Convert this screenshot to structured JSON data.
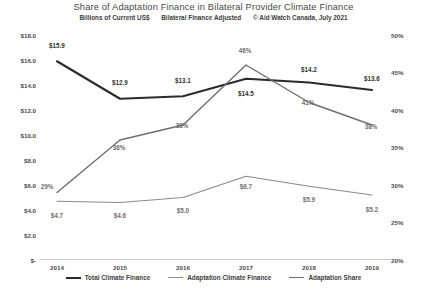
{
  "chart_data": {
    "type": "line",
    "title": "Share of Adaptation Finance in Bilateral Provider Climate Finance",
    "subtitle_parts": [
      "Billions of Current US$",
      "Bilateral Finance Adjusted",
      "© Aid Watch Canada, July 2021"
    ],
    "xlabel": "",
    "ylabel": "",
    "categories": [
      "2014",
      "2015",
      "2016",
      "2017",
      "2018",
      "2019"
    ],
    "x": [
      2014,
      2015,
      2016,
      2017,
      2018,
      2019
    ],
    "grid": false,
    "legend_position": "bottom",
    "y_left": {
      "label": "Billions of Current US$",
      "ticks": [
        "$18.0",
        "$16.0",
        "$14.0",
        "$12.0",
        "$10.0",
        "$8.0",
        "$6.0",
        "$4.0",
        "$2.0",
        "$-"
      ],
      "tick_values": [
        18.0,
        16.0,
        14.0,
        12.0,
        10.0,
        8.0,
        6.0,
        4.0,
        2.0,
        0.0
      ],
      "ylim": [
        0,
        18
      ]
    },
    "y_right": {
      "label": "Adaptation Share",
      "ticks": [
        "50%",
        "45%",
        "40%",
        "35%",
        "30%",
        "25%",
        "20%"
      ],
      "tick_values": [
        50,
        45,
        40,
        35,
        30,
        25,
        20
      ],
      "ylim": [
        20,
        50
      ]
    },
    "series": [
      {
        "name": "Total Climate Finance",
        "axis": "left",
        "color": "#2b2b2b",
        "width": 2.1,
        "values": [
          15.9,
          12.9,
          13.1,
          14.5,
          14.2,
          13.6
        ],
        "labels": [
          "$15.9",
          "$12.9",
          "$13.1",
          "$14.5",
          "$14.2",
          "$13.6"
        ]
      },
      {
        "name": "Adaptation Climate Finance",
        "axis": "left",
        "color": "#8a8a8a",
        "width": 1.2,
        "values": [
          4.7,
          4.6,
          5.0,
          6.7,
          5.9,
          5.2
        ],
        "labels": [
          "$4.7",
          "$4.6",
          "$5.0",
          "$6.7",
          "$5.9",
          "$5.2"
        ]
      },
      {
        "name": "Adaptation Share",
        "axis": "right",
        "color": "#6f6f6f",
        "width": 1.4,
        "values": [
          29,
          36,
          38,
          46,
          41,
          38
        ],
        "labels": [
          "29%",
          "36%",
          "38%",
          "46%",
          "41%",
          "38%"
        ]
      }
    ]
  }
}
